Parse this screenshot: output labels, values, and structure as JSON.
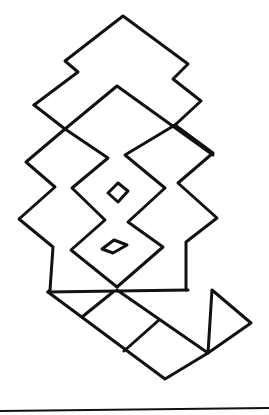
{
  "drawing": {
    "description": "Hand-drawn geometric line figure: stacked zigzag diamond shapes with two small inner diamonds, a rectangular base, a diagonal segmented band and a triangle, above a horizontal rule",
    "stroke_color": "#111111",
    "background_color": "#ffffff",
    "width": 269,
    "height": 415,
    "paths": [
      {
        "name": "top-notched-diamond",
        "points": "34,105 78,72 65,61 123,16 188,64 173,79 201,101 175,125"
      },
      {
        "name": "top-diamond-left-lower",
        "points": "34,105 65,129"
      },
      {
        "name": "second-diamond-outline",
        "points": "65,129 117,86 213,155"
      },
      {
        "name": "left-outer-zigzag",
        "points": "65,129 26,162 55,187 19,219 53,247 50,290"
      },
      {
        "name": "left-inner-zigzag",
        "points": "65,129 108,158 72,188 105,220 71,250 117,287"
      },
      {
        "name": "right-inner-zigzag",
        "points": "175,125 125,155 165,188 128,222 163,247 117,287"
      },
      {
        "name": "right-outer-zigzag",
        "points": "175,125 213,153 178,183 217,218 186,242 186,290"
      },
      {
        "name": "small-diamond-upper",
        "points": "118,183 128,191 118,202 108,193 118,183"
      },
      {
        "name": "small-diamond-lower",
        "points": "114,240 127,245 113,253 102,249 114,240"
      },
      {
        "name": "base-line",
        "points": "48,292 188,290"
      },
      {
        "name": "base-left-edge",
        "points": "50,290 48,292"
      },
      {
        "name": "band-lower-edge",
        "points": "48,292 165,379 208,353"
      },
      {
        "name": "band-upper-edge",
        "points": "117,290 208,353"
      },
      {
        "name": "band-cross-1",
        "points": "113,292 82,317"
      },
      {
        "name": "band-cross-2",
        "points": "159,320 124,351"
      },
      {
        "name": "triangle",
        "points": "212,290 251,323 208,353 212,290"
      }
    ],
    "rule": {
      "x1": 0,
      "y1": 411,
      "x2": 269,
      "y2": 408
    }
  }
}
